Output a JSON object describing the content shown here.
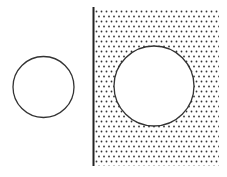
{
  "diagram": {
    "canvas": {
      "width": 227,
      "height": 177,
      "background": "#ffffff"
    },
    "colors": {
      "stroke": "#333333",
      "dot": "#333333",
      "fill": "#ffffff"
    },
    "small_circle": {
      "cx": 43.5,
      "cy": 87,
      "r": 30.5,
      "stroke_width": 1.3
    },
    "dotted_region": {
      "x": 95,
      "y": 8,
      "width": 124,
      "height": 158,
      "dot_spacing": 5,
      "dot_radius": 0.9
    },
    "wall_line": {
      "x": 93.5,
      "y1": 7,
      "y2": 166,
      "stroke_width": 2
    },
    "large_circle": {
      "cx": 154,
      "cy": 86,
      "r": 40,
      "stroke_width": 1.3
    }
  }
}
